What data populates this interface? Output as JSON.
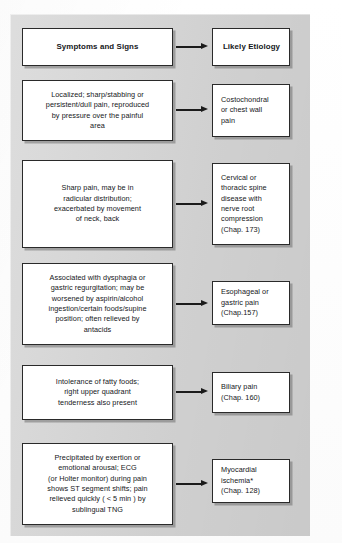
{
  "figure": {
    "title_left": "Symptoms and Signs",
    "title_right": "Likely Etiology",
    "background_color": "#d6d6d6",
    "box_fill": "#ffffff",
    "box_border": "#2a2a2a",
    "arrow_color": "#1b1b1b"
  },
  "headers": {
    "left": "Symptoms and Signs",
    "right": "Likely Etiology"
  },
  "rows": [
    {
      "symptom": "Localized; sharp/stabbing or\npersistent/dull pain, reproduced\nby pressure over the painful\narea",
      "etiology": "Costochondral\nor chest wall\npain",
      "arrow": "arrow-right"
    },
    {
      "symptom": "Sharp pain, may be in\nradicular distribution;\nexacerbated by movement\nof neck, back",
      "etiology": "Cervical or\nthoracic spine\ndisease with\nnerve root\ncompression\n(Chap. 173)",
      "arrow": "arrow-right"
    },
    {
      "symptom": "Associated with dysphagia or\ngastric regurgitation; may be\nworsened by aspirin/alcohol\ningestion/certain foods/supine\nposition; often relieved by\nantacids",
      "etiology": "Esophageal or\ngastric pain\n(Chap.157)",
      "arrow": "arrow-right"
    },
    {
      "symptom": "Intolerance of fatty foods;\nright upper quadrant\ntenderness also present",
      "etiology": "Biliary pain\n(Chap. 160)",
      "arrow": "arrow-right"
    },
    {
      "symptom": "Precipitated by exertion or\nemotional arousal; ECG\n(or Holter monitor) during pain\nshows ST segment shifts; pain\nrelieved quickly ( < 5 min ) by\nsublingual TNG",
      "etiology": "Myocardial\nischemia*\n(Chap. 128)",
      "arrow": "arrow-right"
    }
  ]
}
